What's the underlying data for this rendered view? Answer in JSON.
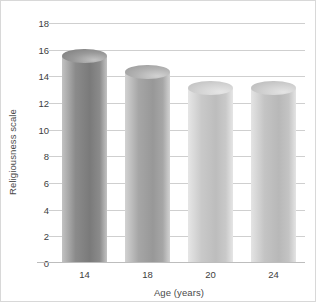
{
  "chart_data": {
    "type": "bar",
    "title": "",
    "subtitle": "",
    "xlabel": "Age (years)",
    "ylabel": "Religiousness scale",
    "categories": [
      "14",
      "18",
      "20",
      "24"
    ],
    "values": [
      15.5,
      14.3,
      13.1,
      13.1
    ],
    "series": [
      {
        "name": "Religiousness scale",
        "values": [
          15.5,
          14.3,
          13.1,
          13.1
        ]
      }
    ],
    "ylim": [
      0,
      18
    ],
    "ytick_values": [
      18,
      16,
      14,
      12,
      10,
      8,
      6,
      4,
      2,
      0
    ],
    "ytick_labels": [
      "18",
      "16",
      "14",
      "12",
      "10",
      "8",
      "6",
      "4",
      "2",
      "0"
    ],
    "ytick_step": 2,
    "xtick_labels": [
      "14",
      "18",
      "20",
      "24"
    ],
    "grid": true,
    "grid_axis": "y",
    "legend": false,
    "legend_position": "none",
    "style": "3d-cylinder",
    "annotations": [],
    "bar_colors": [
      "#8b8b8b",
      "#a6a6a6",
      "#c9c9c9",
      "#c4c4c4"
    ],
    "bar_colors_light": [
      "#c2c2c2",
      "#d2d2d2",
      "#e6e6e6",
      "#e4e4e4"
    ],
    "bar_colors_dark": [
      "#7a7a7a",
      "#989898",
      "#bdbdbd",
      "#b8b8b8"
    ],
    "bar_top_colors": [
      "#9a9a9a",
      "#b4b4b4",
      "#d4d4d4",
      "#d0d0d0"
    ],
    "grid_color": "#cfcfcf",
    "axis_color": "#bdbdbd",
    "text_color": "#3d3d3d",
    "label_color": "#4a4a4a",
    "background_color": "#ffffff",
    "border_color": "#d8d8d8"
  }
}
